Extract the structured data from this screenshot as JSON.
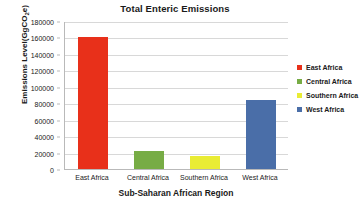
{
  "chart_data": {
    "type": "bar",
    "title": "Total Enteric Emissions",
    "xlabel": "Sub-Saharan African Region",
    "ylabel": "Emissions Level(GgCO2e)",
    "ylabel_prefix": "Emissions Level(GgCO",
    "ylabel_sub": "2",
    "ylabel_suffix": "e)",
    "categories": [
      "East Africa",
      "Central Africa",
      "Southern Africa",
      "West Africa"
    ],
    "values": [
      160000,
      22000,
      15500,
      84000
    ],
    "colors": [
      "#E8301A",
      "#77AC45",
      "#E9EC34",
      "#4A6EA8"
    ],
    "ylim": [
      0,
      180000
    ],
    "yticks": [
      0,
      20000,
      40000,
      60000,
      80000,
      100000,
      120000,
      140000,
      160000,
      180000
    ],
    "ytick_labels": [
      "0",
      "20000",
      "40000",
      "60000",
      "80000",
      "100000",
      "120000",
      "140000",
      "160000",
      "180000"
    ],
    "grid": true,
    "legend_position": "right",
    "legend": [
      {
        "label": "East Africa",
        "color": "#E8301A"
      },
      {
        "label": "Central Africa",
        "color": "#77AC45"
      },
      {
        "label": "Southern Africa",
        "color": "#E9EC34"
      },
      {
        "label": "West Africa",
        "color": "#4A6EA8"
      }
    ]
  }
}
